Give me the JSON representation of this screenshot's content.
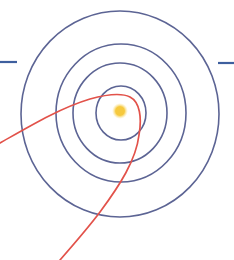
{
  "diagram": {
    "colors": {
      "background": "#ffffff",
      "orbit": "#5c6494",
      "trajectory": "#e2524a",
      "star_core": "#f6c93e",
      "star_glow": "#fbe79a",
      "side_line": "#3e5f9e"
    },
    "star": {
      "name": "sun"
    },
    "orbits": [
      {
        "name": "orbit-1"
      },
      {
        "name": "orbit-2"
      },
      {
        "name": "orbit-3"
      },
      {
        "name": "orbit-4"
      }
    ],
    "trajectory": {
      "name": "hyperbolic-trajectory"
    },
    "side_lines": [
      {
        "name": "left-marker-line"
      },
      {
        "name": "right-marker-line"
      }
    ]
  }
}
